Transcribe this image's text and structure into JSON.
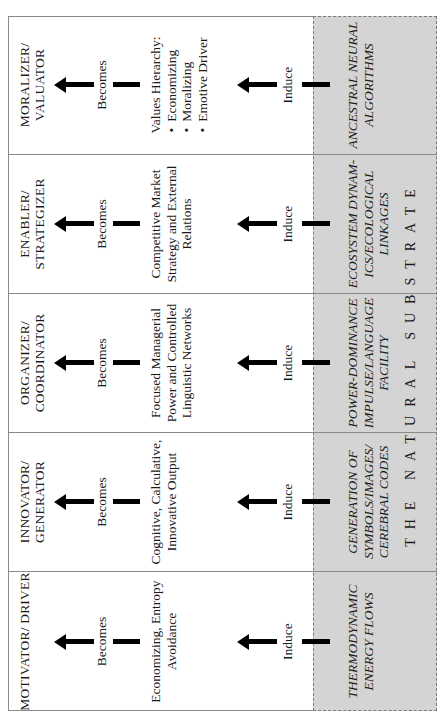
{
  "diagram": {
    "columns": [
      {
        "role": "MOTIVATOR/ DRIVER",
        "becomes_label": "Becomes",
        "description": "Economizing, Entropy Avoidance",
        "induce_label": "Induce",
        "substrate": "THERMODYNAMIC ENERGY FLOWS"
      },
      {
        "role": "INNOVATOR/ GENERATOR",
        "becomes_label": "Becomes",
        "description": "Cognitive, Calculative, Innovative Output",
        "induce_label": "Induce",
        "substrate": "GENERATION OF SYMBOLS/IMAGES/ CEREBRAL CODES"
      },
      {
        "role": "ORGANIZER/ COORDINATOR",
        "becomes_label": "Becomes",
        "description": "Focused Managerial Power and Controlled Linguistic Networks",
        "induce_label": "Induce",
        "substrate": "POWER-DOMINANCE IMPULSE/LANGUAGE FACILITY"
      },
      {
        "role": "ENABLER/ STRATEGIZER",
        "becomes_label": "Becomes",
        "description": "Competitive Market Strategy and External Relations",
        "induce_label": "Induce",
        "substrate": "ECOSYSTEM DYNAM- ICS/ECOLOGICAL LINKAGES"
      },
      {
        "role": "MORALIZER/ VALUATOR",
        "becomes_label": "Becomes",
        "description": "Values Hierarchy:",
        "description_bullets": [
          "Economizing",
          "Moralizing",
          "Emotive Driver"
        ],
        "induce_label": "Induce",
        "substrate": "ANCESTRAL NEURAL ALGORITHMS"
      }
    ],
    "banner": "THE NATURAL SUBSTRATE",
    "colors": {
      "substrate_fill": "#d4d4d4",
      "border": "#8a8a8a",
      "arrow": "#000000"
    },
    "icons": {
      "becomes_arrow": "arrow-up-icon",
      "induce_arrow": "arrow-up-icon"
    }
  }
}
